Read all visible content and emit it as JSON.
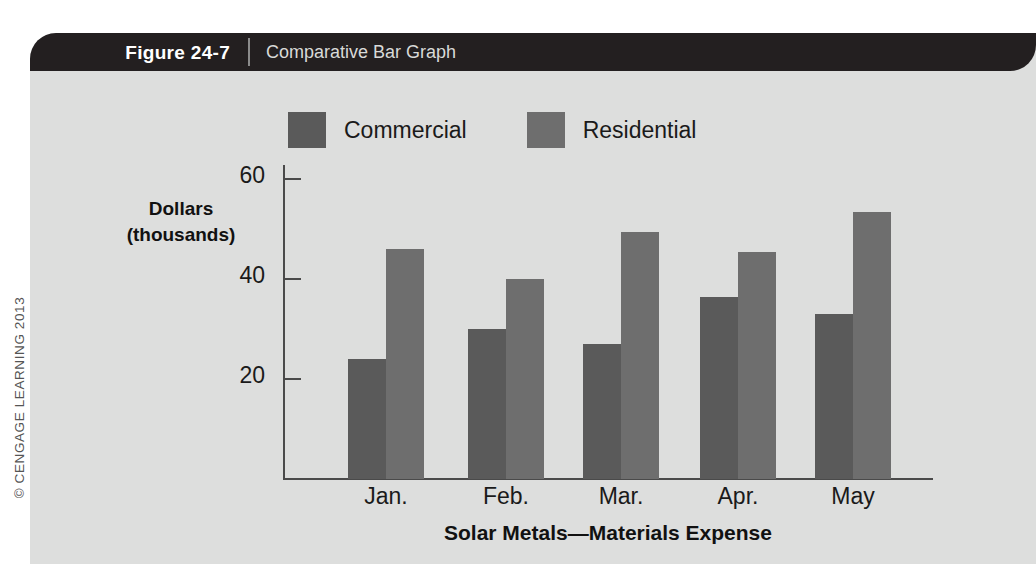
{
  "figure": {
    "number_label": "Figure 24-7",
    "title": "Comparative Bar Graph",
    "copyright": "© CENGAGE LEARNING 2013"
  },
  "colors": {
    "panel_background": "#dddedd",
    "header_background": "#231f20",
    "header_number_text": "#ffffff",
    "header_title_text": "#d9dad8",
    "axis": "#4a4a4a",
    "commercial": "#5a5a5a",
    "residential": "#6e6e6e",
    "text": "#1a1a1a"
  },
  "chart_data": {
    "type": "bar",
    "title": "Comparative Bar Graph",
    "xlabel": "Solar Metals—Materials Expense",
    "ylabel": "Dollars (thousands)",
    "ylabel_lines": [
      "Dollars",
      "(thousands)"
    ],
    "categories": [
      "Jan.",
      "Feb.",
      "Mar.",
      "Apr.",
      "May"
    ],
    "series": [
      {
        "name": "Commercial",
        "color": "#5a5a5a",
        "values": [
          24,
          30,
          27,
          36.5,
          33
        ]
      },
      {
        "name": "Residential",
        "color": "#6e6e6e",
        "values": [
          46,
          40,
          49.5,
          45.5,
          53.5
        ]
      }
    ],
    "ylim": [
      0,
      64
    ],
    "yticks": [
      20,
      40,
      60
    ],
    "ytick_labels": [
      "20",
      "40",
      "60"
    ],
    "grid": false,
    "legend_position": "top"
  }
}
